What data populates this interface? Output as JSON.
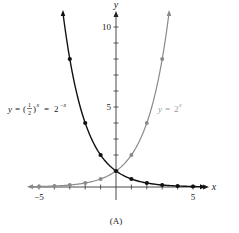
{
  "chart_data": {
    "type": "line",
    "title": "",
    "caption": "(A)",
    "xlabel": "x",
    "ylabel": "y",
    "xlim": [
      -5.6,
      5.7
    ],
    "ylim": [
      0,
      11
    ],
    "x_tick_labels": [
      "−5",
      "5"
    ],
    "x_ticks": [
      -5,
      -4,
      -3,
      -2,
      -1,
      1,
      2,
      3,
      4,
      5
    ],
    "y_tick_labels": [
      "5",
      "10"
    ],
    "y_ticks": [
      1,
      2,
      3,
      4,
      5,
      6,
      7,
      8,
      9,
      10
    ],
    "grid": false,
    "legend": "inline annotations",
    "series": [
      {
        "name": "y = (1/2)^x = 2^(−x)",
        "color": "#111111",
        "x": [
          -3,
          -2,
          -1,
          0,
          1,
          2,
          3,
          4,
          5
        ],
        "values": [
          8,
          4,
          2,
          1,
          0.5,
          0.25,
          0.125,
          0.0625,
          0.03125
        ]
      },
      {
        "name": "y = 2^x",
        "color": "#8a8a8a",
        "x": [
          -5,
          -4,
          -3,
          -2,
          -1,
          0,
          1,
          2,
          3
        ],
        "values": [
          0.03125,
          0.0625,
          0.125,
          0.25,
          0.5,
          1,
          2,
          4,
          8
        ]
      }
    ],
    "annotations": [
      {
        "series": 0,
        "label_prefix": "y = (",
        "frac_num": "1",
        "frac_den": "2",
        "label_mid": ")",
        "sup1": "x",
        "label_eq": " = 2",
        "sup2": "−x"
      },
      {
        "series": 1,
        "label_base": "y = 2",
        "sup": "x"
      }
    ]
  }
}
